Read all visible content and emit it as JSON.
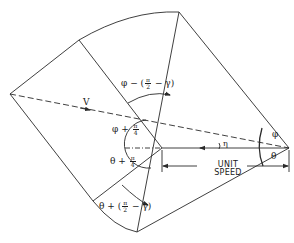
{
  "diagram": {
    "type": "velocity-geometry",
    "stroke_color": "#2a2a2a",
    "labels": {
      "v": "V",
      "eta": "η",
      "phi": "φ",
      "theta": "θ",
      "unit_speed_line1": "UNIT",
      "unit_speed_line2": "SPEED",
      "phi_minus": {
        "prefix": "φ − (",
        "num": "π",
        "den": "2",
        "suffix": " − γ)"
      },
      "phi_plus": {
        "prefix": "φ + ",
        "num": "π",
        "den": "4"
      },
      "theta_plus": {
        "prefix": "θ + ",
        "num": "π",
        "den": "4"
      },
      "theta_plus_gamma": {
        "prefix": "θ + (",
        "num": "π",
        "den": "2",
        "suffix": " − γ)"
      }
    }
  }
}
